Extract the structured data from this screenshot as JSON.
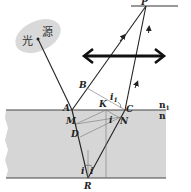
{
  "diagram": {
    "type": "optics-refraction-diagram",
    "light_source": {
      "label": "光 源",
      "chars": [
        "光",
        "源"
      ],
      "fill": "#d9d9d9"
    },
    "points": {
      "P": "P",
      "B": "B",
      "A": "A",
      "K": "K",
      "C": "C",
      "M": "M",
      "N": "N",
      "D": "D",
      "R": "R"
    },
    "angles": {
      "i1": "i",
      "i1_sub": "1",
      "i": "i",
      "i_left": "i",
      "i_right": "i"
    },
    "media": {
      "upper": "n",
      "upper_sub": "1",
      "lower": "n"
    },
    "colors": {
      "medium": "#d6d6d6",
      "line": "#222222",
      "screen": "#333333"
    }
  }
}
